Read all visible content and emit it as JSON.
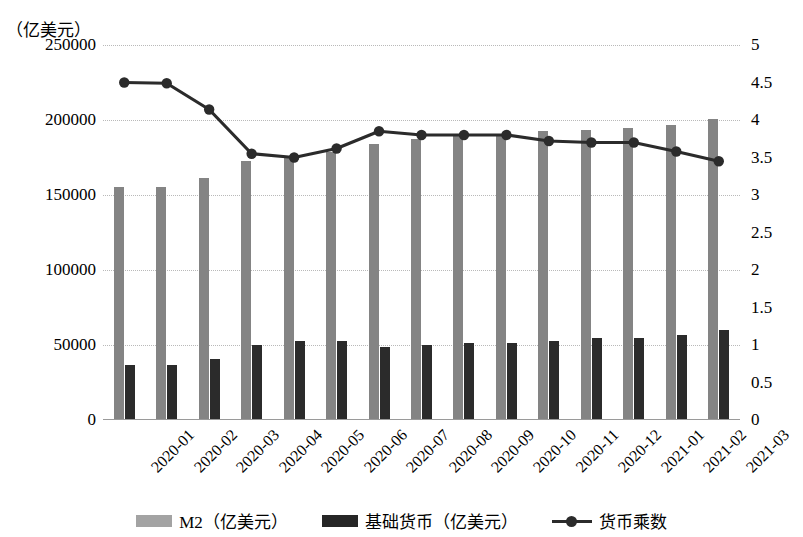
{
  "chart_data": {
    "type": "bar",
    "title": "",
    "unit_caption": "（亿美元）",
    "categories": [
      "2020-01",
      "2020-02",
      "2020-03",
      "2020-04",
      "2020-05",
      "2020-06",
      "2020-07",
      "2020-08",
      "2020-09",
      "2020-10",
      "2020-11",
      "2020-12",
      "2021-01",
      "2021-02",
      "2021-03"
    ],
    "series": [
      {
        "name": "M2（亿美元）",
        "type": "bar",
        "axis": "left",
        "color": "#848484",
        "values": [
          155500,
          155500,
          161500,
          173000,
          175000,
          179000,
          184000,
          187500,
          189500,
          191000,
          192500,
          193500,
          194500,
          196500,
          201000
        ]
      },
      {
        "name": "基础货币（亿美元）",
        "type": "bar",
        "axis": "left",
        "color": "#2b2b2b",
        "values": [
          36500,
          36500,
          41000,
          50000,
          53000,
          52500,
          48500,
          50000,
          51500,
          51500,
          53000,
          54500,
          54500,
          56500,
          60000
        ]
      },
      {
        "name": "货币乘数",
        "type": "line",
        "axis": "right",
        "color": "#2b2b2b",
        "values": [
          4.5,
          4.49,
          4.14,
          3.55,
          3.5,
          3.62,
          3.85,
          3.8,
          3.8,
          3.8,
          3.72,
          3.7,
          3.7,
          3.58,
          3.45
        ]
      }
    ],
    "left_axis": {
      "label": "（亿美元）",
      "ticks": [
        "0",
        "50000",
        "100000",
        "150000",
        "200000",
        "250000"
      ],
      "tick_values": [
        0,
        50000,
        100000,
        150000,
        200000,
        250000
      ],
      "min": 0,
      "max": 250000
    },
    "right_axis": {
      "label": "",
      "ticks": [
        "0",
        "0.5",
        "1",
        "1.5",
        "2",
        "2.5",
        "3",
        "3.5",
        "4",
        "4.5",
        "5"
      ],
      "tick_values": [
        0,
        0.5,
        1,
        1.5,
        2,
        2.5,
        3,
        3.5,
        4,
        4.5,
        5
      ],
      "min": 0,
      "max": 5
    },
    "xlabel": "",
    "grid": true,
    "legend_position": "bottom"
  },
  "legend": {
    "items": [
      {
        "label": "M2（亿美元）",
        "kind": "bar-gray"
      },
      {
        "label": "基础货币（亿美元）",
        "kind": "bar-black"
      },
      {
        "label": "货币乘数",
        "kind": "line-marker"
      }
    ]
  }
}
